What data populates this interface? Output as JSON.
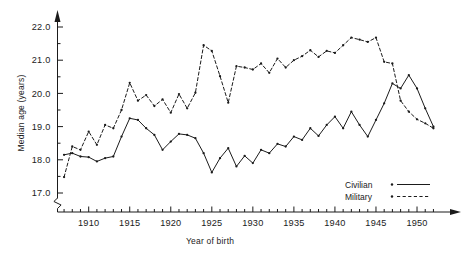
{
  "chart_data": {
    "type": "line",
    "title": "",
    "xlabel": "Year of birth",
    "ylabel": "Median age (years)",
    "xlim": [
      1906.2,
      1952.8
    ],
    "ylim": [
      16.72,
      22.28
    ],
    "yticks": [
      17.0,
      18.0,
      19.0,
      20.0,
      21.0,
      22.0
    ],
    "ytick_labels": [
      "17.0",
      "18.0",
      "19.0",
      "20.0",
      "21.0",
      "22.0"
    ],
    "xticks": [
      1910,
      1915,
      1920,
      1925,
      1930,
      1935,
      1940,
      1945,
      1950
    ],
    "xtick_labels": [
      "1910",
      "1915",
      "1920",
      "1925",
      "1930",
      "1935",
      "1940",
      "1945",
      "1950"
    ],
    "minor_xtick_step": 1,
    "minor_ytick_step": 0.5,
    "grid": false,
    "axis_break_y": true,
    "axis_arrows": true,
    "legend_position": "lower-right",
    "x": [
      1907,
      1908,
      1909,
      1910,
      1911,
      1912,
      1913,
      1914,
      1915,
      1916,
      1917,
      1918,
      1919,
      1920,
      1921,
      1922,
      1923,
      1924,
      1925,
      1926,
      1927,
      1928,
      1929,
      1930,
      1931,
      1932,
      1933,
      1934,
      1935,
      1936,
      1937,
      1938,
      1939,
      1940,
      1941,
      1942,
      1943,
      1944,
      1945,
      1946,
      1947,
      1948,
      1949,
      1950,
      1951,
      1952
    ],
    "series": [
      {
        "name": "Civilian",
        "style": "solid",
        "marker": "dot",
        "values": [
          18.15,
          18.2,
          18.1,
          18.08,
          17.95,
          18.05,
          18.1,
          18.7,
          19.25,
          19.2,
          18.95,
          18.75,
          18.3,
          18.55,
          18.78,
          18.75,
          18.65,
          18.2,
          17.62,
          18.05,
          18.35,
          17.8,
          18.12,
          17.9,
          18.3,
          18.2,
          18.48,
          18.4,
          18.7,
          18.6,
          18.95,
          18.72,
          19.05,
          19.3,
          18.95,
          19.45,
          19.05,
          18.7,
          19.2,
          19.7,
          20.3,
          20.15,
          20.55,
          20.15,
          19.55,
          19.0
        ]
      },
      {
        "name": "Military",
        "style": "dashed",
        "marker": "dot",
        "values": [
          17.48,
          18.4,
          18.3,
          18.85,
          18.45,
          19.05,
          18.95,
          19.5,
          20.32,
          19.78,
          19.95,
          19.62,
          19.82,
          19.42,
          19.98,
          19.55,
          20.02,
          21.45,
          21.28,
          20.52,
          19.72,
          20.82,
          20.78,
          20.72,
          20.9,
          20.62,
          21.05,
          20.78,
          21.0,
          21.12,
          21.3,
          21.1,
          21.28,
          21.22,
          21.45,
          21.68,
          21.62,
          21.55,
          21.68,
          20.95,
          20.9,
          19.78,
          19.45,
          19.22,
          19.1,
          18.95
        ]
      }
    ]
  },
  "legend": {
    "items": [
      {
        "label": "Civilian",
        "style": "solid"
      },
      {
        "label": "Military",
        "style": "dashed"
      }
    ]
  }
}
